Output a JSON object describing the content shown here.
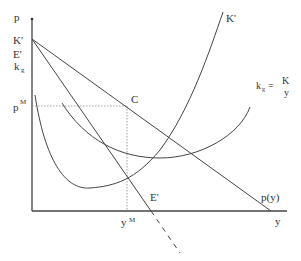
{
  "diagram": {
    "axes": {
      "y_label": "p",
      "x_label": "y"
    },
    "intercept_labels": [
      "K'",
      "E'",
      "k"
    ],
    "intercept_label_sub": "g",
    "price_label": "p",
    "price_label_sup": "M",
    "quantity_label": "y",
    "quantity_label_sup": "M",
    "point_label": "C",
    "curves": {
      "K_prime": "K'",
      "E_prime": "E'",
      "demand": "p(y)",
      "kg_lhs": "k",
      "kg_sub": "g",
      "kg_eq": "=",
      "kg_num": "K",
      "kg_den": "y"
    },
    "colors": {
      "line": "#444444",
      "dotted": "#888888",
      "text": "#333333"
    }
  }
}
